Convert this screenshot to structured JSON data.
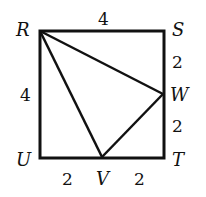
{
  "diagram": {
    "type": "geometry",
    "shape": "square RSTU with triangle RWV",
    "points": {
      "R": {
        "label": "R"
      },
      "S": {
        "label": "S"
      },
      "T": {
        "label": "T"
      },
      "U": {
        "label": "U"
      },
      "V": {
        "label": "V"
      },
      "W": {
        "label": "W"
      }
    },
    "lengths": {
      "RS": "4",
      "RU": "4",
      "SW": "2",
      "WT": "2",
      "UV": "2",
      "VT": "2"
    },
    "stroke_color": "#111111"
  }
}
